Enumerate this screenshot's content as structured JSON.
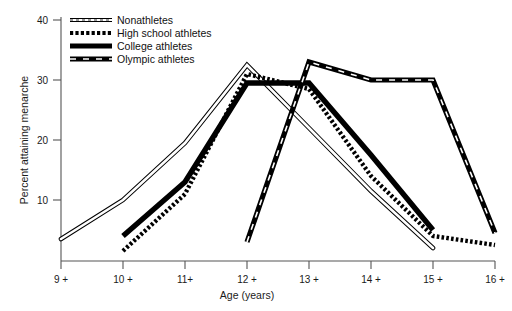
{
  "chart_data": {
    "type": "line",
    "title": "",
    "xlabel": "Age (years)",
    "ylabel": "Percent attaining menarche",
    "x_tick_labels": [
      "9 +",
      "10 +",
      "11+",
      "12 +",
      "13 +",
      "14 +",
      "15 +",
      "16 +"
    ],
    "x_values": [
      9,
      10,
      11,
      12,
      13,
      14,
      15,
      16
    ],
    "y_tick_labels": [
      "10",
      "20",
      "30",
      "40"
    ],
    "y_ticks": [
      10,
      20,
      30,
      40
    ],
    "ylim": [
      0,
      40
    ],
    "xlim": [
      9,
      16
    ],
    "grid": false,
    "legend_position": "top-left",
    "series": [
      {
        "name": "Nonathletes",
        "style": "double-line",
        "color": "#000000",
        "x": [
          9,
          10,
          11,
          12,
          13,
          14,
          15
        ],
        "values": [
          3.5,
          10.0,
          19.5,
          32.5,
          22.0,
          11.5,
          2.0
        ]
      },
      {
        "name": "High school athletes",
        "style": "dotted",
        "color": "#000000",
        "x": [
          10,
          11,
          12,
          13,
          14,
          15,
          16
        ],
        "values": [
          1.5,
          11.0,
          31.0,
          28.5,
          14.0,
          4.0,
          2.5
        ]
      },
      {
        "name": "College athletes",
        "style": "thick-solid",
        "color": "#000000",
        "x": [
          10,
          11,
          12,
          13,
          14,
          15
        ],
        "values": [
          4.0,
          13.0,
          29.5,
          29.5,
          17.5,
          5.0
        ]
      },
      {
        "name": "Olympic athletes",
        "style": "dash-dot",
        "color": "#000000",
        "x": [
          12,
          13,
          14,
          15,
          16
        ],
        "values": [
          3.0,
          33.0,
          30.0,
          30.0,
          4.5
        ]
      }
    ]
  },
  "legend": {
    "items": [
      {
        "label": "Nonathletes",
        "swatch": "double-line-swatch"
      },
      {
        "label": "High school athletes",
        "swatch": "dotted-swatch"
      },
      {
        "label": "College athletes",
        "swatch": "thick-solid-swatch"
      },
      {
        "label": "Olympic athletes",
        "swatch": "dash-dot-swatch"
      }
    ]
  },
  "axes": {
    "y_label": "Percent attaining menarche",
    "x_label": "Age (years)",
    "y_tick_0": "10",
    "y_tick_1": "20",
    "y_tick_2": "30",
    "y_tick_3": "40",
    "x_tick_0": "9 +",
    "x_tick_1": "10 +",
    "x_tick_2": "11+",
    "x_tick_3": "12 +",
    "x_tick_4": "13 +",
    "x_tick_5": "14 +",
    "x_tick_6": "15 +",
    "x_tick_7": "16 +"
  }
}
